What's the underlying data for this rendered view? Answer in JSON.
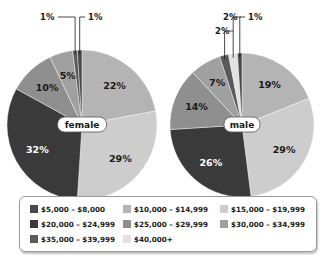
{
  "chart_data": [
    {
      "type": "pie",
      "title": "female",
      "center_label": "female",
      "slices": [
        {
          "category": "$10,000 – $14,999",
          "value": 22,
          "label": "22%"
        },
        {
          "category": "$15,000 – $19,999",
          "value": 29,
          "label": "29%"
        },
        {
          "category": "$20,000 – $24,999",
          "value": 32,
          "label": "32%"
        },
        {
          "category": "$25,000 – $29,999",
          "value": 10,
          "label": "10%"
        },
        {
          "category": "$30,000 – $34,999",
          "value": 5,
          "label": "5%"
        },
        {
          "category": "$35,000 – $39,999",
          "value": 1,
          "label": "1%",
          "callout": true
        },
        {
          "category": "$5,000 – $8,000",
          "value": 1,
          "label": "1%",
          "callout": true
        }
      ]
    },
    {
      "type": "pie",
      "title": "male",
      "center_label": "male",
      "slices": [
        {
          "category": "$10,000 – $14,999",
          "value": 19,
          "label": "19%"
        },
        {
          "category": "$15,000 – $19,999",
          "value": 29,
          "label": "29%"
        },
        {
          "category": "$20,000 – $24,999",
          "value": 26,
          "label": "26%"
        },
        {
          "category": "$25,000 – $29,999",
          "value": 14,
          "label": "14%"
        },
        {
          "category": "$30,000 – $34,999",
          "value": 7,
          "label": "7%"
        },
        {
          "category": "$35,000 – $39,999",
          "value": 2,
          "label": "2%",
          "callout": true
        },
        {
          "category": "$40,000+",
          "value": 2,
          "label": "2%",
          "callout": true
        },
        {
          "category": "$5,000 – $8,000",
          "value": 1,
          "label": "1%",
          "callout": true
        }
      ]
    }
  ],
  "legend": {
    "placement": "bottom",
    "items": [
      {
        "label": "$5,000 – $8,000",
        "color": "#4a4a4a"
      },
      {
        "label": "$10,000 – $14,999",
        "color": "#b4b4b4"
      },
      {
        "label": "$15,000 – $19,999",
        "color": "#cdcdcd"
      },
      {
        "label": "$20,000 – $24,999",
        "color": "#3a3a3a"
      },
      {
        "label": "$25,000 – $29,999",
        "color": "#8f8f8f"
      },
      {
        "label": "$30,000 – $34,999",
        "color": "#a0a0a0"
      },
      {
        "label": "$35,000 – $39,999",
        "color": "#5a5a5a"
      },
      {
        "label": "$40,000+",
        "color": "#e2e2e2"
      }
    ]
  }
}
